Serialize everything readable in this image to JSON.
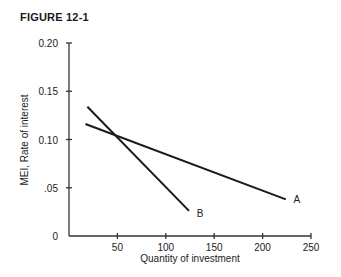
{
  "figure": {
    "title": "FIGURE 12-1"
  },
  "chart_data": {
    "type": "line",
    "title": "FIGURE 12-1",
    "xlabel": "Quantity of investment",
    "ylabel": "MEI,  Rate of interest",
    "xlim": [
      0,
      250
    ],
    "ylim": [
      0,
      0.2
    ],
    "x_ticks": [
      50,
      100,
      150,
      200,
      250
    ],
    "x_tick_labels": [
      "50",
      "100",
      "150",
      "200",
      "250"
    ],
    "y_ticks": [
      0,
      0.05,
      0.1,
      0.15,
      0.2
    ],
    "y_tick_labels": [
      "0",
      ".05",
      "0.10",
      "0.15",
      "0.20"
    ],
    "grid": false,
    "legend": "inline labels at line ends",
    "series": [
      {
        "name": "A",
        "x": [
          17,
          224
        ],
        "y": [
          0.116,
          0.038
        ]
      },
      {
        "name": "B",
        "x": [
          19,
          124
        ],
        "y": [
          0.134,
          0.026
        ]
      }
    ],
    "annotations": [
      {
        "text": "A",
        "x": 232,
        "y": 0.038
      },
      {
        "text": "B",
        "x": 132,
        "y": 0.024
      }
    ]
  }
}
